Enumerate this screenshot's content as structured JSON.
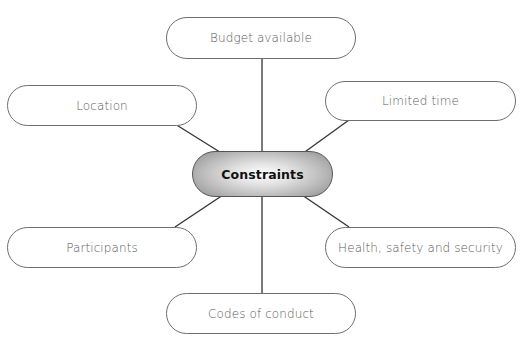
{
  "diagram": {
    "type": "mind-map",
    "center": {
      "label": "Constraints",
      "style": {
        "fill": "grey radial gradient",
        "text_color": "#111111"
      }
    },
    "nodes": [
      {
        "id": "budget",
        "label": "Budget available",
        "position": "top"
      },
      {
        "id": "location",
        "label": "Location",
        "position": "upper-left"
      },
      {
        "id": "limited-time",
        "label": "Limited time",
        "position": "upper-right"
      },
      {
        "id": "participants",
        "label": "Participants",
        "position": "lower-left"
      },
      {
        "id": "health-safety",
        "label": "Health, safety and security",
        "position": "lower-right"
      },
      {
        "id": "codes",
        "label": "Codes of conduct",
        "position": "bottom"
      }
    ],
    "edges": [
      {
        "from": "Constraints",
        "to": "Budget available"
      },
      {
        "from": "Constraints",
        "to": "Location"
      },
      {
        "from": "Constraints",
        "to": "Limited time"
      },
      {
        "from": "Constraints",
        "to": "Participants"
      },
      {
        "from": "Constraints",
        "to": "Health, safety and security"
      },
      {
        "from": "Constraints",
        "to": "Codes of conduct"
      }
    ],
    "colors": {
      "node_border": "#6e6e6e",
      "node_text": "#5a5a5a",
      "connector": "#333333",
      "background": "#ffffff"
    }
  }
}
